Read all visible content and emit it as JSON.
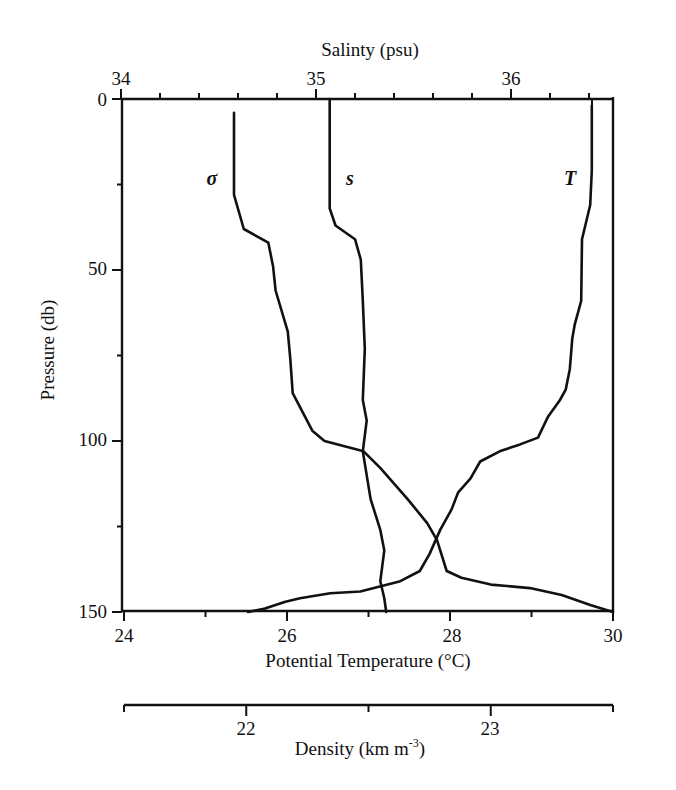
{
  "chart_data": {
    "type": "line",
    "title": "",
    "orientation": "vertical profiles (pressure increasing downward)",
    "y_axis": {
      "label": "Pressure (db)",
      "range": [
        0,
        150
      ],
      "inverted": true,
      "ticks": [
        0,
        50,
        100,
        150
      ],
      "minor_ticks": [
        25,
        75,
        125
      ]
    },
    "x_axes": [
      {
        "id": "temperature",
        "position": "bottom",
        "label": "Potential Temperature (°C)",
        "range": [
          24,
          30
        ],
        "ticks": [
          24,
          26,
          28,
          30
        ],
        "minor_ticks": [
          25,
          27,
          29
        ]
      },
      {
        "id": "salinity",
        "position": "top",
        "label": "Salinty (psu)",
        "range": [
          34,
          36.5
        ],
        "ticks": [
          34,
          35,
          36
        ],
        "minor_ticks": [
          34.2,
          34.4,
          34.6,
          34.8,
          35.2,
          35.4,
          35.6,
          35.8,
          36.2,
          36.4
        ]
      },
      {
        "id": "density",
        "position": "separate bottom",
        "label": "Density (km m",
        "label_superscript": "-3",
        "label_suffix": ")",
        "range": [
          21.5,
          23.5
        ],
        "ticks": [
          22,
          23
        ],
        "minor_ticks": [
          21.5,
          22.5,
          23.5
        ]
      }
    ],
    "grid": false,
    "legend": "inline curve labels",
    "series": [
      {
        "name": "σ",
        "label": "σ",
        "axis": "density",
        "pressure": [
          4,
          28,
          38,
          42,
          49,
          56,
          68,
          76,
          86,
          97,
          100,
          103,
          108,
          117,
          124,
          129,
          138,
          140,
          142,
          143,
          145,
          148,
          150
        ],
        "values": [
          21.95,
          21.95,
          21.99,
          22.09,
          22.11,
          22.12,
          22.17,
          22.18,
          22.19,
          22.27,
          22.32,
          22.48,
          22.55,
          22.66,
          22.74,
          22.78,
          22.82,
          22.88,
          23.0,
          23.16,
          23.29,
          23.41,
          23.5
        ]
      },
      {
        "name": "s",
        "label": "s",
        "axis": "salinity",
        "pressure": [
          0,
          32,
          37,
          41,
          47,
          59,
          73,
          88,
          94,
          103,
          117,
          126,
          132,
          141,
          146,
          150
        ],
        "values": [
          35.07,
          35.07,
          35.1,
          35.2,
          35.23,
          35.24,
          35.25,
          35.24,
          35.26,
          35.24,
          35.28,
          35.33,
          35.35,
          35.33,
          35.35,
          35.36
        ]
      },
      {
        "name": "T",
        "label": "T",
        "axis": "temperature",
        "pressure": [
          2,
          21,
          31,
          37,
          41,
          59,
          66,
          70,
          79,
          85,
          88,
          93,
          99,
          101,
          103,
          106,
          111,
          115,
          120,
          126,
          133,
          138,
          141,
          144,
          144.5,
          146,
          147,
          149,
          150
        ],
        "values": [
          29.74,
          29.74,
          29.72,
          29.66,
          29.62,
          29.61,
          29.53,
          29.5,
          29.47,
          29.42,
          29.35,
          29.2,
          29.08,
          28.86,
          28.61,
          28.37,
          28.25,
          28.1,
          28.02,
          27.88,
          27.75,
          27.63,
          27.39,
          26.9,
          26.53,
          26.16,
          25.98,
          25.73,
          25.52
        ]
      }
    ],
    "annotations": [
      {
        "text": "σ",
        "pressure": 23,
        "near": "σ curve, left side"
      },
      {
        "text": "s",
        "pressure": 23,
        "near": "s curve, right side"
      },
      {
        "text": "T",
        "pressure": 23,
        "near": "T curve, left side"
      }
    ]
  },
  "labels": {
    "salinity_title": "Salinty (psu)",
    "temperature_title": "Potential Temperature (°C)",
    "pressure_title": "Pressure (db)",
    "density_title_main": "Density (km m",
    "density_title_sup": "-3",
    "density_title_end": ")",
    "sal_ticks": [
      "34",
      "35",
      "36"
    ],
    "pres_ticks": [
      "0",
      "50",
      "100",
      "150"
    ],
    "temp_ticks": [
      "24",
      "26",
      "28",
      "30"
    ],
    "dens_ticks": [
      "22",
      "23"
    ],
    "curve_sigma": "σ",
    "curve_s": "s",
    "curve_T": "T"
  }
}
